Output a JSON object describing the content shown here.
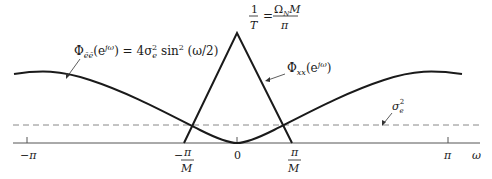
{
  "figure": {
    "labels": {
      "noise_psd_lhs": "Φ",
      "noise_psd_sub": "ẽẽ",
      "noise_psd_arg": "(e",
      "noise_psd_exp": "jω",
      "noise_psd_rhs": ") = 4σ",
      "noise_psd_sigma_sub": "e",
      "noise_psd_sigma_sup": "2",
      "noise_psd_sin": " sin",
      "noise_psd_sin_sup": "2",
      "noise_psd_tail": " (ω/2)",
      "signal_psd_lhs": "Φ",
      "signal_psd_sub": "xx",
      "signal_psd_arg": "(e",
      "signal_psd_exp": "jω",
      "signal_psd_close": ")",
      "peak_num": "1",
      "peak_den": "T",
      "peak_eq": "=",
      "peak_rhs_num_omega": "Ω",
      "peak_rhs_num_sub": "N",
      "peak_rhs_num_m": "M",
      "peak_rhs_den": "π",
      "sigma_label": "σ",
      "sigma_sub": "e",
      "sigma_sup": "2"
    },
    "axis": {
      "ticks": [
        {
          "label": "−π"
        },
        {
          "label": "0"
        },
        {
          "label": "π"
        }
      ],
      "neg_pi_over_m_sign": "−",
      "pi_over_m_num": "π",
      "pi_over_m_den": "M",
      "omega_label": "ω"
    },
    "colors": {
      "curve": "#1a1a1a",
      "dashed": "#888888",
      "axis": "#555555"
    }
  }
}
